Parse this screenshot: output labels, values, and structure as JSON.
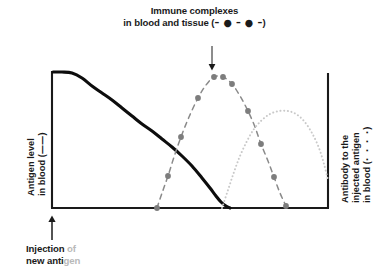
{
  "figure": {
    "width": 389,
    "height": 279,
    "background": "#ffffff"
  },
  "top_caption": {
    "line1": "Immune complexes",
    "line2_text": "in blood and tissue (",
    "line2_glyph": "– ● – ● –",
    "line2_close": ")"
  },
  "bottom_caption": {
    "line1_strong": "Injection",
    "line1_faded": " of",
    "line2_strong": "new anti",
    "line2_faded": "gen"
  },
  "left_axis_label": {
    "line1_text": "Antigen level",
    "line2_text": "in blood (",
    "line2_glyph": "——",
    "line2_close": ")"
  },
  "right_axis_label": {
    "line1": "Antibody to the",
    "line2": "injected antigen",
    "line3_text": "in blood (",
    "line3_glyph": "· · · ·",
    "line3_close": ")"
  },
  "colors": {
    "antigen_line": "#0d0d0d",
    "immune_complex_line": "#8a8a8a",
    "immune_complex_marker": "#7d7d7d",
    "antibody_line": "#c9c9c9",
    "axis": "#1a1a1a",
    "arrow": "#1a1a1a",
    "text": "#1a1a1a",
    "faded_text": "#b9b9b9"
  },
  "chart_data": {
    "type": "line",
    "title": "Immune complexes in blood and tissue",
    "xlabel": "",
    "ylabel": "Antigen level in blood",
    "y2label": "Antibody to the injected antigen in blood",
    "grid": false,
    "legend": "inline-in-axis-labels",
    "xlim": [
      0,
      100
    ],
    "ylim": [
      0,
      100
    ],
    "axis_frame": {
      "left_x": 52,
      "right_x": 328,
      "top_y": 72,
      "baseline_y": 208
    },
    "annotations": [
      {
        "text": "Injection of new antigen",
        "arrow": "up",
        "x_px": 52,
        "y_px": 208
      },
      {
        "text": "Immune complexes in blood and tissue",
        "arrow": "down",
        "x_px": 212,
        "y_px": 76
      }
    ],
    "series": [
      {
        "name": "Antigen level in blood",
        "style": "solid",
        "color": "#0d0d0d",
        "width": 3.1,
        "markers": false,
        "points_px": [
          [
            53,
            72
          ],
          [
            62,
            72
          ],
          [
            72,
            73
          ],
          [
            82,
            78
          ],
          [
            92,
            86
          ],
          [
            102,
            93
          ],
          [
            112,
            100
          ],
          [
            122,
            108
          ],
          [
            132,
            116
          ],
          [
            142,
            124
          ],
          [
            152,
            131
          ],
          [
            162,
            139
          ],
          [
            172,
            147
          ],
          [
            182,
            156
          ],
          [
            192,
            166
          ],
          [
            202,
            178
          ],
          [
            210,
            188
          ],
          [
            216,
            196
          ],
          [
            221,
            202
          ],
          [
            226,
            206
          ],
          [
            230,
            208
          ]
        ]
      },
      {
        "name": "Immune complexes in blood and tissue",
        "style": "dashed-with-dots",
        "color": "#8a8a8a",
        "width": 1.5,
        "markers": true,
        "marker_radius": 2.9,
        "marker_color": "#7d7d7d",
        "points_px": [
          [
            157,
            208
          ],
          [
            162,
            193
          ],
          [
            168,
            176
          ],
          [
            174,
            157
          ],
          [
            181,
            137
          ],
          [
            189,
            117
          ],
          [
            198,
            98
          ],
          [
            206,
            85
          ],
          [
            214,
            77
          ],
          [
            223,
            77
          ],
          [
            232,
            84
          ],
          [
            240,
            96
          ],
          [
            248,
            111
          ],
          [
            255,
            127
          ],
          [
            261,
            144
          ],
          [
            268,
            161
          ],
          [
            274,
            177
          ],
          [
            280,
            193
          ],
          [
            286,
            206
          ]
        ],
        "marker_points_px": [
          [
            157,
            208
          ],
          [
            168,
            176
          ],
          [
            181,
            137
          ],
          [
            198,
            98
          ],
          [
            214,
            77
          ],
          [
            223,
            77
          ],
          [
            232,
            84
          ],
          [
            248,
            111
          ],
          [
            261,
            144
          ],
          [
            274,
            177
          ],
          [
            286,
            206
          ]
        ]
      },
      {
        "name": "Antibody to the injected antigen in blood",
        "style": "dotted",
        "color": "#c9c9c9",
        "width": 2.0,
        "markers": false,
        "points_px": [
          [
            222,
            208
          ],
          [
            228,
            190
          ],
          [
            234,
            172
          ],
          [
            240,
            156
          ],
          [
            247,
            141
          ],
          [
            254,
            129
          ],
          [
            262,
            120
          ],
          [
            270,
            114
          ],
          [
            279,
            111
          ],
          [
            288,
            111
          ],
          [
            296,
            114
          ],
          [
            304,
            121
          ],
          [
            312,
            133
          ],
          [
            319,
            148
          ],
          [
            324,
            164
          ],
          [
            328,
            180
          ]
        ]
      }
    ]
  }
}
